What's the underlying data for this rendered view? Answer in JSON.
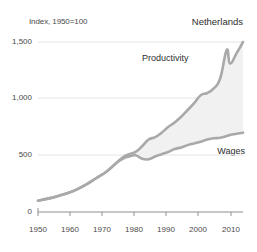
{
  "chart_data": {
    "type": "area",
    "title": "",
    "subtitle": "Index, 1950=100",
    "country": "Netherlands",
    "xlabel": "",
    "ylabel": "Index, 1950=100",
    "xlim": [
      1950,
      2013
    ],
    "ylim": [
      0,
      1600
    ],
    "grid": true,
    "legend_position": "inline-annotation",
    "y_ticks": [
      "0",
      "500",
      "1,000",
      "1,500"
    ],
    "y_tick_values": [
      0,
      500,
      1000,
      1500
    ],
    "x_ticks": [
      "1950",
      "1960",
      "1970",
      "1980",
      "1990",
      "2000",
      "2010"
    ],
    "x_tick_values": [
      1950,
      1960,
      1970,
      1980,
      1990,
      2000,
      2010
    ],
    "x": [
      1950,
      1953,
      1956,
      1959,
      1962,
      1965,
      1968,
      1971,
      1974,
      1976,
      1978,
      1980,
      1982,
      1984,
      1986,
      1988,
      1990,
      1992,
      1994,
      1996,
      1998,
      2000,
      2002,
      2004,
      2006,
      2008,
      2009,
      2011,
      2013
    ],
    "series": [
      {
        "name": "Productivity",
        "color": "#a9a9a9",
        "values": [
          100,
          118,
          140,
          165,
          200,
          245,
          300,
          355,
          430,
          480,
          510,
          530,
          580,
          640,
          660,
          700,
          750,
          790,
          840,
          900,
          960,
          1030,
          1050,
          1090,
          1180,
          1430,
          1310,
          1400,
          1500
        ]
      },
      {
        "name": "Wages",
        "color": "#a9a9a9",
        "values": [
          100,
          118,
          140,
          165,
          200,
          245,
          300,
          355,
          430,
          470,
          490,
          500,
          470,
          465,
          490,
          510,
          530,
          555,
          570,
          590,
          605,
          620,
          640,
          650,
          655,
          670,
          680,
          690,
          700
        ]
      }
    ],
    "fill_between": {
      "upper": "Productivity",
      "lower": "Wages",
      "color": "#f1f1f1"
    },
    "annotations": [
      {
        "text": "Netherlands",
        "position": "top-right"
      },
      {
        "text": "Productivity",
        "position": "upper-right-inline"
      },
      {
        "text": "Wages",
        "position": "mid-right-inline"
      }
    ],
    "style": {
      "line_color": "#a9a9a9",
      "fill_color": "#f1f1f1",
      "grid_color": "#e2e2e2",
      "axis_color": "#9a9a9a",
      "text_color": "#3a3a3a",
      "background": "#ffffff"
    }
  }
}
